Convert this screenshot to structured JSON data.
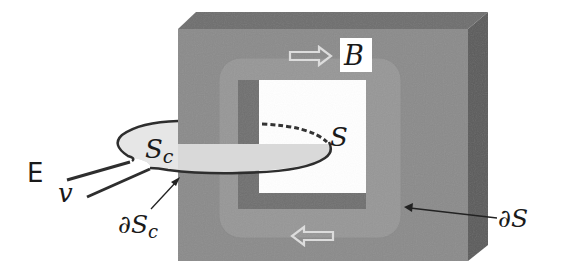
{
  "figure": {
    "colors": {
      "background": "#ffffff",
      "core_front": "#8b8b8b",
      "core_top": "#6e6e6e",
      "core_side": "#5e5e5e",
      "flux_path": "#9a9a9a",
      "inner_frame": "#6f6f6f",
      "window": "#ffffff",
      "surface_sc": "#dadada",
      "wire": "#333333",
      "arrow_outline": "#d8d8d8"
    }
  },
  "labels": {
    "B": "B",
    "S": "S",
    "Sc_main": "S",
    "Sc_sub": "c",
    "E": "E",
    "v": "v",
    "dSc_main": "∂S",
    "dSc_sub": "c",
    "dS": "∂S"
  },
  "arrows": {
    "flux_top_direction": "right",
    "flux_bottom_direction": "left"
  }
}
